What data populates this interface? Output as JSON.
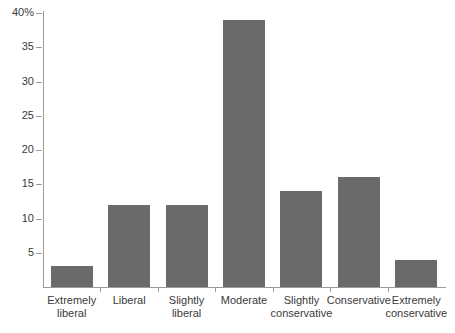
{
  "chart_data": {
    "type": "bar",
    "title": "",
    "subtitle": "",
    "xlabel": "",
    "ylabel": "",
    "categories": [
      "Extremely liberal",
      "Liberal",
      "Slightly liberal",
      "Moderate",
      "Slightly conservative",
      "Conservative",
      "Extremely conservative"
    ],
    "category_lines": [
      [
        "Extremely",
        "liberal"
      ],
      [
        "Liberal",
        ""
      ],
      [
        "Slightly",
        "liberal"
      ],
      [
        "Moderate",
        ""
      ],
      [
        "Slightly",
        "conservative"
      ],
      [
        "Conservative",
        ""
      ],
      [
        "Extremely",
        "conservative"
      ]
    ],
    "values": [
      3,
      12,
      12,
      39,
      14,
      16,
      4
    ],
    "ylim": [
      0,
      40
    ],
    "ytick_values": [
      5,
      10,
      15,
      20,
      25,
      30,
      35,
      40
    ],
    "ytick_labels": [
      "5",
      "10",
      "15",
      "20",
      "25",
      "30",
      "35",
      "40%"
    ],
    "grid": false,
    "legend": false,
    "legend_position": "none",
    "bar_color": "#6a6a6a",
    "axis_color": "#9a9a9a",
    "text_color": "#3a3a3a",
    "background_color": "#ffffff"
  }
}
